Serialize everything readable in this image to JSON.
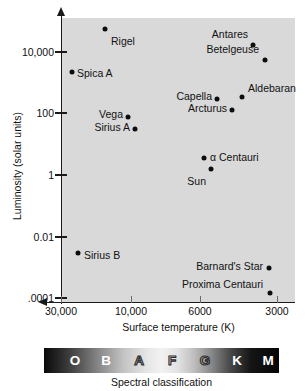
{
  "chart_data": {
    "type": "scatter",
    "title": "",
    "xlabel": "Surface temperature (K)",
    "ylabel": "Luminosity (solar units)",
    "x_ticks": [
      "30,000",
      "10,000",
      "6000",
      "3000"
    ],
    "y_ticks": [
      "10,000",
      "100",
      "1",
      "0.01",
      ".0001"
    ],
    "x_axis_reversed": true,
    "y_axis_scale": "log",
    "grid": false,
    "legend": "none",
    "plot_background": "#d9d9d9",
    "point_color": "#0d0d0d",
    "points": [
      {
        "name": "Rigel",
        "temperature_k": 11000,
        "luminosity_solar": 60000,
        "label_pos": "below-right"
      },
      {
        "name": "Spica A",
        "temperature_k": 22000,
        "luminosity_solar": 2200,
        "label_pos": "right"
      },
      {
        "name": "Antares",
        "temperature_k": 3400,
        "luminosity_solar": 12000,
        "label_pos": "above-left"
      },
      {
        "name": "Betelgeuse",
        "temperature_k": 3100,
        "luminosity_solar": 6500,
        "label_pos": "above-left"
      },
      {
        "name": "Capella",
        "temperature_k": 5200,
        "luminosity_solar": 180,
        "label_pos": "left"
      },
      {
        "name": "Aldebaran",
        "temperature_k": 4000,
        "luminosity_solar": 240,
        "label_pos": "above-right"
      },
      {
        "name": "Arcturus",
        "temperature_k": 4300,
        "luminosity_solar": 110,
        "label_pos": "left"
      },
      {
        "name": "Vega",
        "temperature_k": 9600,
        "luminosity_solar": 55,
        "label_pos": "left"
      },
      {
        "name": "Sirius A",
        "temperature_k": 9200,
        "luminosity_solar": 26,
        "label_pos": "left"
      },
      {
        "name": "α Centauri",
        "temperature_k": 5800,
        "luminosity_solar": 1.6,
        "label_pos": "right"
      },
      {
        "name": "Sun",
        "temperature_k": 5500,
        "luminosity_solar": 1.0,
        "label_pos": "below-left"
      },
      {
        "name": "Sirius B",
        "temperature_k": 24000,
        "luminosity_solar": 0.0028,
        "label_pos": "right"
      },
      {
        "name": "Barnard's Star",
        "temperature_k": 3200,
        "luminosity_solar": 0.00045,
        "label_pos": "left"
      },
      {
        "name": "Proxima Centauri",
        "temperature_k": 3100,
        "luminosity_solar": 6e-05,
        "label_pos": "left"
      }
    ]
  },
  "axes": {
    "y_ticks": [
      {
        "label": "10,000",
        "top": 52
      },
      {
        "label": "100",
        "top": 113
      },
      {
        "label": "1",
        "top": 175
      },
      {
        "label": "0.01",
        "top": 237
      },
      {
        "label": ".0001",
        "top": 298
      }
    ],
    "x_ticks": [
      {
        "label": "30,000",
        "left": 61
      },
      {
        "label": "10,000",
        "left": 131
      },
      {
        "label": "6000",
        "left": 200
      },
      {
        "label": "3000",
        "left": 277
      }
    ],
    "x_title": "Surface temperature (K)",
    "y_title": "Luminosity (solar units)"
  },
  "stars": [
    {
      "name": "Rigel",
      "dot": {
        "left": 105,
        "top": 29
      },
      "label": {
        "left": 111,
        "top": 41
      },
      "anchor": "lbl-right"
    },
    {
      "name": "Spica A",
      "dot": {
        "left": 72,
        "top": 72
      },
      "label": {
        "left": 77,
        "top": 73
      },
      "anchor": "lbl-right"
    },
    {
      "name": "Antares",
      "dot": {
        "left": 253,
        "top": 45
      },
      "label": {
        "left": 248,
        "top": 34
      },
      "anchor": "lbl-left"
    },
    {
      "name": "Betelgeuse",
      "dot": {
        "left": 265,
        "top": 60
      },
      "label": {
        "left": 259,
        "top": 49
      },
      "anchor": "lbl-left"
    },
    {
      "name": "Capella",
      "dot": {
        "left": 217,
        "top": 99
      },
      "label": {
        "left": 212,
        "top": 96
      },
      "anchor": "lbl-left"
    },
    {
      "name": "Aldebaran",
      "dot": {
        "left": 242,
        "top": 97
      },
      "label": {
        "left": 248,
        "top": 88
      },
      "anchor": "lbl-right"
    },
    {
      "name": "Arcturus",
      "dot": {
        "left": 232,
        "top": 110
      },
      "label": {
        "left": 227,
        "top": 108
      },
      "anchor": "lbl-left"
    },
    {
      "name": "Vega",
      "dot": {
        "left": 128,
        "top": 117
      },
      "label": {
        "left": 123,
        "top": 114
      },
      "anchor": "lbl-left"
    },
    {
      "name": "Sirius A",
      "dot": {
        "left": 135,
        "top": 129
      },
      "label": {
        "left": 130,
        "top": 127
      },
      "anchor": "lbl-left"
    },
    {
      "name": "α Centauri",
      "dot": {
        "left": 204,
        "top": 158
      },
      "label": {
        "left": 210,
        "top": 157
      },
      "anchor": "lbl-right"
    },
    {
      "name": "Sun",
      "dot": {
        "left": 211,
        "top": 169
      },
      "label": {
        "left": 206,
        "top": 181
      },
      "anchor": "lbl-left"
    },
    {
      "name": "Sirius B",
      "dot": {
        "left": 78,
        "top": 253
      },
      "label": {
        "left": 84,
        "top": 255
      },
      "anchor": "lbl-right"
    },
    {
      "name": "Barnard's Star",
      "dot": {
        "left": 269,
        "top": 268
      },
      "label": {
        "left": 263,
        "top": 266
      },
      "anchor": "lbl-left"
    },
    {
      "name": "Proxima Centauri",
      "dot": {
        "left": 270,
        "top": 293
      },
      "label": {
        "left": 263,
        "top": 284
      },
      "anchor": "lbl-left"
    }
  ],
  "spectral": {
    "caption": "Spectral classification",
    "classes": [
      {
        "letter": "O",
        "left": 31,
        "style": "spec-solid"
      },
      {
        "letter": "B",
        "left": 62,
        "style": "spec-solid"
      },
      {
        "letter": "A",
        "left": 95,
        "style": "spec-outline-dark"
      },
      {
        "letter": "F",
        "left": 128,
        "style": "spec-outline-dark"
      },
      {
        "letter": "G",
        "left": 161,
        "style": "spec-outline-dark"
      },
      {
        "letter": "K",
        "left": 193,
        "style": "spec-solid"
      },
      {
        "letter": "M",
        "left": 224,
        "style": "spec-solid"
      }
    ]
  }
}
